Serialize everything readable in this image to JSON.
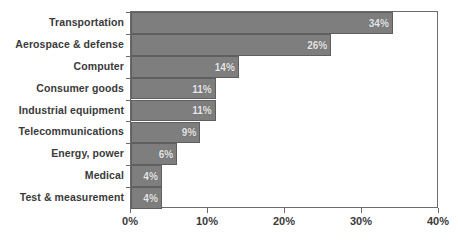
{
  "chart_data": {
    "type": "bar",
    "orientation": "horizontal",
    "title": "",
    "xlabel": "",
    "ylabel": "",
    "xlim": [
      0,
      40
    ],
    "grid": false,
    "legend": null,
    "bar_color": "#7e7e7e",
    "categories": [
      "Transportation",
      "Aerospace & defense",
      "Computer",
      "Consumer goods",
      "Industrial equipment",
      "Telecommunications",
      "Energy, power",
      "Medical",
      "Test & measurement"
    ],
    "values": [
      34,
      26,
      14,
      11,
      11,
      9,
      6,
      4,
      4
    ],
    "value_labels": [
      "34%",
      "26%",
      "14%",
      "11%",
      "11%",
      "9%",
      "6%",
      "4%",
      "4%"
    ],
    "xticks": [
      0,
      10,
      20,
      30,
      40
    ],
    "xticklabels": [
      "0%",
      "10%",
      "20%",
      "30%",
      "40%"
    ]
  }
}
